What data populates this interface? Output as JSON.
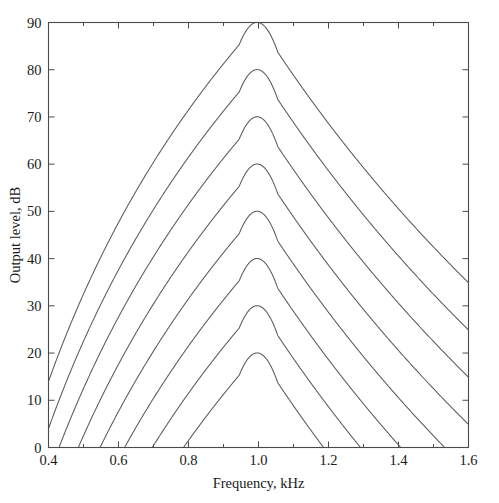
{
  "chart_data": {
    "type": "line",
    "title": "",
    "xlabel": "Frequency, kHz",
    "ylabel": "Output level, dB",
    "xlim": [
      0.4,
      1.6
    ],
    "ylim": [
      0,
      90
    ],
    "xticks": [
      0.4,
      0.6,
      0.8,
      1.0,
      1.2,
      1.4,
      1.6
    ],
    "xticklabels": [
      "0.4",
      "0.6",
      "0.8",
      "1.0",
      "1.2",
      "1.4",
      "1.6"
    ],
    "xminor_step": 0.1,
    "yticks": [
      0,
      10,
      20,
      30,
      40,
      50,
      60,
      70,
      80,
      90
    ],
    "yticklabels": [
      "0",
      "10",
      "20",
      "30",
      "40",
      "50",
      "60",
      "70",
      "80",
      "90"
    ],
    "grid": "off",
    "legend": "none",
    "box": "on",
    "ticks_direction": "in",
    "peak_frequency_khz": 1.0,
    "series": [
      {
        "name": "90 dB",
        "peak_value": 90,
        "left_edge_value": 60.0,
        "right_edge_value": 37.0
      },
      {
        "name": "80 dB",
        "peak_value": 80,
        "left_edge_value": 41.0,
        "right_edge_value": 27.0
      },
      {
        "name": "70 dB",
        "peak_value": 70,
        "left_edge_value": 22.0,
        "right_edge_value": 19.0
      },
      {
        "name": "60 dB",
        "peak_value": 60,
        "left_edge_value": 1.0,
        "right_edge_value": 9.0
      },
      {
        "name": "50 dB",
        "peak_value": 50,
        "left_zero_crossing_khz": 0.53,
        "right_zero_crossing_khz": 1.55
      },
      {
        "name": "40 dB",
        "peak_value": 40,
        "left_zero_crossing_khz": 0.665,
        "right_zero_crossing_khz": 1.425
      },
      {
        "name": "30 dB",
        "peak_value": 30,
        "left_zero_crossing_khz": 0.765,
        "right_zero_crossing_khz": 1.32
      },
      {
        "name": "20 dB",
        "peak_value": 20,
        "left_zero_crossing_khz": 0.855,
        "right_zero_crossing_khz": 1.215
      }
    ]
  }
}
